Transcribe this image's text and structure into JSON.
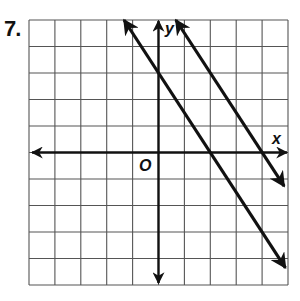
{
  "problem": {
    "number": "7."
  },
  "chart_data": {
    "type": "line",
    "title": "",
    "xlabel": "x",
    "ylabel": "y",
    "origin_label": "O",
    "xlim": [
      -5,
      5
    ],
    "ylim": [
      -5,
      5
    ],
    "grid": true,
    "grid_step": 1,
    "tick_labels": false,
    "series": [
      {
        "name": "line-1",
        "equation": "y = -3/2 x + 3",
        "slope": -1.5,
        "y_intercept": 3,
        "x_intercept": 2,
        "points": [
          [
            -1.33,
            5
          ],
          [
            0,
            3
          ],
          [
            2,
            0
          ],
          [
            4.9,
            -4.35
          ]
        ],
        "arrows": "both"
      },
      {
        "name": "line-2",
        "equation": "y = -3/2 x + 6",
        "slope": -1.5,
        "y_intercept": 6,
        "x_intercept": 4,
        "points": [
          [
            0.67,
            5
          ],
          [
            2,
            3
          ],
          [
            4,
            0
          ],
          [
            4.85,
            -1.27
          ]
        ],
        "arrows": "both"
      }
    ],
    "annotations": [
      "lines are parallel (equal slopes -3/2)"
    ]
  },
  "colors": {
    "grid": "#555555",
    "axes": "#111111",
    "lines": "#111111",
    "background": "#ffffff"
  }
}
